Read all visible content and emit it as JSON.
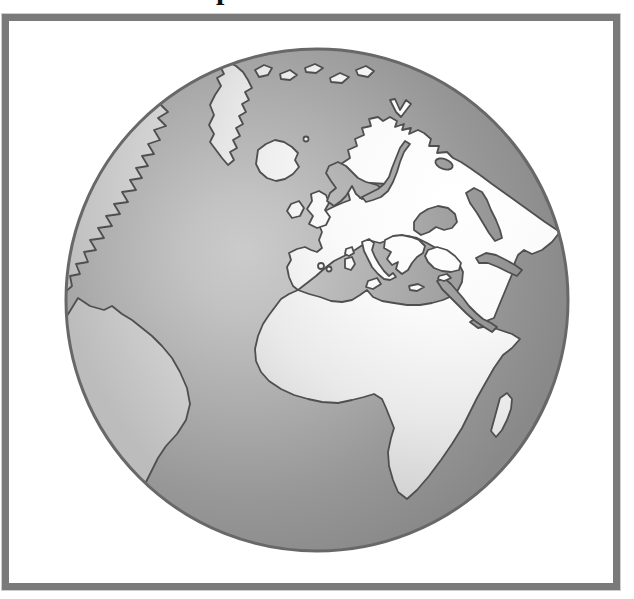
{
  "title_fragment": "p",
  "colors": {
    "page-bg": "#ffffff",
    "frame-border": "#7a7a7a",
    "frame-bg": "#ffffff",
    "globe-rim": "#686868",
    "coast-outline": "#4f4f4f",
    "ocean-center": "#cbcbcb",
    "ocean-edge": "#898989",
    "land-center": "#ffffff",
    "land-edge": "#bcbcbc"
  },
  "globe": {
    "description": "Stylized grayscale globe (orthographic view) centered on Europe and Africa inside a gray picture frame",
    "landmasses": [
      "North America coast",
      "South America",
      "Greenland",
      "Iceland",
      "Great Britain",
      "Ireland",
      "Arctic islands",
      "Eurasia with Scandinavia and Arabia",
      "Africa",
      "Madagascar"
    ],
    "water_bodies": [
      "Atlantic Ocean",
      "Arctic Ocean",
      "North Sea",
      "Baltic Sea",
      "Lake Ladoga",
      "Mediterranean Sea",
      "Black Sea",
      "Caspian Sea",
      "Persian Gulf",
      "Red Sea",
      "Indian Ocean"
    ],
    "islands_in_seas": [
      "Balkans and Greece",
      "Anatolia",
      "Italy",
      "Sicily",
      "Corsica",
      "Sardinia",
      "Balearic Islands",
      "Crete",
      "Cyprus"
    ]
  }
}
